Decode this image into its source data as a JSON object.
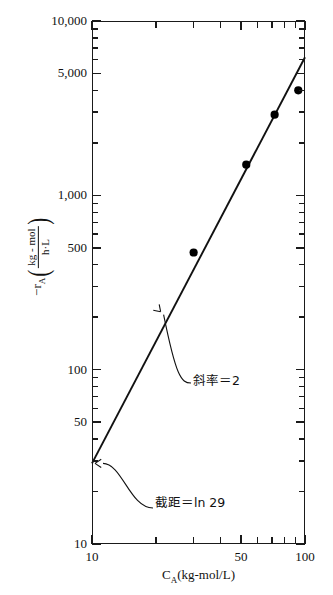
{
  "chart_data": {
    "type": "scatter",
    "title": "",
    "xlabel": "C_A (kg-mol/L)",
    "ylabel": "-r_A (kg-mol / h·L)",
    "xscale": "log",
    "yscale": "log",
    "xlim": [
      10,
      100
    ],
    "ylim": [
      10,
      10000
    ],
    "grid": false,
    "legend": null,
    "x": [
      30,
      53,
      72,
      93
    ],
    "y": [
      470,
      1500,
      2900,
      4000
    ],
    "points": [
      {
        "x": 30,
        "y": 470
      },
      {
        "x": 53,
        "y": 1500
      },
      {
        "x": 72,
        "y": 2900
      },
      {
        "x": 93,
        "y": 4000
      }
    ],
    "series": [
      {
        "name": "data",
        "marker": "filled-circle",
        "values": [
          470,
          1500,
          2900,
          4000
        ]
      },
      {
        "name": "fitted-line",
        "type": "line",
        "slope": 2,
        "intercept_label": "ln 29",
        "endpoints": [
          {
            "x": 10,
            "y": 29
          },
          {
            "x": 100,
            "y": 6200
          }
        ]
      }
    ],
    "x_ticks_major": [
      10,
      50,
      100
    ],
    "x_ticks_major_labels": [
      "10",
      "50",
      "100"
    ],
    "x_ticks_minor": [
      20,
      30,
      40,
      60,
      70,
      80,
      90
    ],
    "y_ticks_major": [
      10,
      50,
      100,
      500,
      1000,
      5000,
      10000
    ],
    "y_ticks_major_labels": [
      "10",
      "50",
      "100",
      "500",
      "1,000",
      "5,000",
      "10,000"
    ],
    "y_ticks_minor": [
      20,
      30,
      40,
      60,
      70,
      80,
      90,
      200,
      300,
      400,
      600,
      700,
      800,
      900,
      2000,
      3000,
      4000,
      6000,
      7000,
      8000,
      9000
    ],
    "annotations": [
      {
        "name": "slope",
        "text": "斜率＝2",
        "points_to": {
          "x": 21,
          "y": 215
        }
      },
      {
        "name": "intercept",
        "text": "截距＝ln 29",
        "points_to": {
          "x": 10,
          "y": 29
        }
      }
    ],
    "colors": {
      "axis": "#1a1a1a",
      "line": "#111111",
      "marker": "#000000",
      "background": "#ffffff"
    }
  },
  "axes": {
    "x_title_main": "C",
    "x_title_sub": "A",
    "x_title_units": "(kg-mol/L)",
    "y_title_main": "−r",
    "y_title_sub": "A",
    "y_frac_numerator": "kg - mol",
    "y_frac_denominator": "h·L",
    "paren_open": "(",
    "paren_close": ")"
  },
  "ticks": {
    "y_labels": [
      "10,000",
      "5,000",
      "1,000",
      "500",
      "100",
      "50",
      "10"
    ],
    "x_labels": [
      "10",
      "50",
      "100"
    ]
  },
  "annotations": {
    "slope": "斜率＝2",
    "intercept": "截距＝ln 29"
  }
}
